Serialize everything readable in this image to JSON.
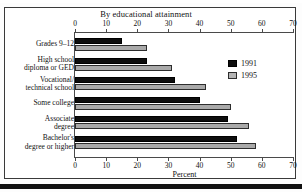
{
  "chart_data": {
    "type": "bar",
    "orientation": "horizontal",
    "title": "By educational attainment",
    "xlabel": "Percent",
    "ylabel": "",
    "xlim": [
      0,
      70
    ],
    "xticks": [
      0,
      10,
      20,
      30,
      40,
      50,
      60,
      70
    ],
    "xtick_labels": [
      "0",
      "10",
      "20",
      "30",
      "40",
      "50",
      "60",
      "70"
    ],
    "axis_top_ticks_shown": true,
    "axis_bottom_ticks_shown": true,
    "grid": false,
    "legend_position": "right-upper",
    "categories": [
      "Grades 9–12",
      "High school\ndiploma or GED",
      "Vocational/\ntechnical school",
      "Some college",
      "Associate\ndegree",
      "Bachelor's\ndegree or higher"
    ],
    "category_lines": [
      [
        "Grades 9–12"
      ],
      [
        "High school",
        "diploma or GED"
      ],
      [
        "Vocational/",
        "technical school"
      ],
      [
        "Some college"
      ],
      [
        "Associate",
        "degree"
      ],
      [
        "Bachelor's",
        "degree or higher"
      ]
    ],
    "series": [
      {
        "name": "1991",
        "color": "#0d0d0d",
        "values": [
          15,
          23,
          32,
          40,
          49,
          52
        ]
      },
      {
        "name": "1995",
        "color": "#a9a9a9",
        "values": [
          23,
          31,
          42,
          50,
          56,
          58
        ]
      }
    ]
  },
  "legend": {
    "items": [
      {
        "label": "1991",
        "series": "1991"
      },
      {
        "label": "1995",
        "series": "1995"
      }
    ]
  },
  "colors": {
    "series_1991": "#0d0d0d",
    "series_1995": "#a9a9a9",
    "axis": "#4a4a4a",
    "frame": "#3a3a3a",
    "text": "#111111",
    "background": "#ffffff"
  }
}
